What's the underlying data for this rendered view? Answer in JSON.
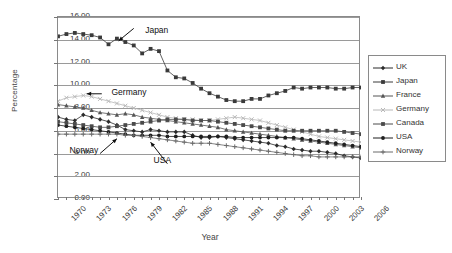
{
  "chart_data": {
    "type": "line",
    "title": "",
    "xlabel": "Year",
    "ylabel": "Percentage",
    "ylim": [
      0,
      16
    ],
    "ytick_labels": [
      "0.00",
      "2.00",
      "4.00",
      "6.00",
      "8.00",
      "10.00",
      "12.00",
      "14.00",
      "16.00"
    ],
    "ytick_values": [
      0,
      2,
      4,
      6,
      8,
      10,
      12,
      14,
      16
    ],
    "xlim": [
      1970,
      2006
    ],
    "xtick_labels": [
      "1970",
      "1973",
      "1976",
      "1979",
      "1982",
      "1985",
      "1988",
      "1991",
      "1994",
      "1997",
      "2000",
      "2003",
      "2006"
    ],
    "xtick_values": [
      1970,
      1973,
      1976,
      1979,
      1982,
      1985,
      1988,
      1991,
      1994,
      1997,
      2000,
      2003,
      2006
    ],
    "grid": "horizontal",
    "legend_position": "right",
    "x": [
      1970,
      1971,
      1972,
      1973,
      1974,
      1975,
      1976,
      1977,
      1978,
      1979,
      1980,
      1981,
      1982,
      1983,
      1984,
      1985,
      1986,
      1987,
      1988,
      1989,
      1990,
      1991,
      1992,
      1993,
      1994,
      1995,
      1996,
      1997,
      1998,
      1999,
      2000,
      2001,
      2002,
      2003,
      2004,
      2005,
      2006
    ],
    "series": [
      {
        "name": "UK",
        "marker": "diamond",
        "color": "#2b2b2b",
        "values": [
          7.2,
          7.0,
          6.9,
          7.4,
          7.2,
          7.0,
          6.8,
          6.5,
          6.1,
          6.0,
          5.9,
          6.1,
          6.0,
          5.9,
          5.9,
          5.9,
          5.6,
          5.4,
          5.4,
          5.5,
          5.4,
          5.3,
          5.2,
          5.1,
          5.0,
          4.9,
          4.7,
          4.6,
          4.4,
          4.3,
          4.2,
          4.2,
          4.1,
          4.0,
          3.8,
          3.7,
          3.6
        ]
      },
      {
        "name": "Japan",
        "marker": "square",
        "color": "#3a3a3a",
        "values": [
          14.3,
          14.5,
          14.6,
          14.5,
          14.4,
          14.2,
          13.6,
          14.1,
          13.8,
          13.5,
          12.8,
          13.2,
          13.0,
          11.3,
          10.7,
          10.6,
          10.2,
          9.7,
          9.3,
          9.0,
          8.7,
          8.6,
          8.6,
          8.8,
          8.8,
          9.1,
          9.3,
          9.5,
          9.8,
          9.7,
          9.8,
          9.8,
          9.8,
          9.7,
          9.7,
          9.8,
          9.8
        ]
      },
      {
        "name": "France",
        "marker": "triangle",
        "color": "#555555",
        "values": [
          8.3,
          8.2,
          8.1,
          8.0,
          7.8,
          7.6,
          7.5,
          7.4,
          7.5,
          7.4,
          7.2,
          7.1,
          7.0,
          6.9,
          6.8,
          6.7,
          6.6,
          6.5,
          6.4,
          6.3,
          6.1,
          6.0,
          5.9,
          5.8,
          5.7,
          5.6,
          5.5,
          5.4,
          5.3,
          5.2,
          5.1,
          5.0,
          4.9,
          4.8,
          4.7,
          4.6,
          4.5
        ]
      },
      {
        "name": "Germany",
        "marker": "x",
        "color": "#b8b8b8",
        "values": [
          8.6,
          8.9,
          9.0,
          9.1,
          9.0,
          8.8,
          8.6,
          8.4,
          8.2,
          8.0,
          7.8,
          7.6,
          7.4,
          7.2,
          7.1,
          7.0,
          7.0,
          6.9,
          6.9,
          7.0,
          7.1,
          7.2,
          7.1,
          7.0,
          6.9,
          6.7,
          6.5,
          6.3,
          6.1,
          5.9,
          5.7,
          5.5,
          5.4,
          5.3,
          5.2,
          5.1,
          5.0
        ]
      },
      {
        "name": "Canada",
        "marker": "square",
        "color": "#4a4a4a",
        "values": [
          6.8,
          6.7,
          6.6,
          6.5,
          6.4,
          6.3,
          6.3,
          6.4,
          6.5,
          6.6,
          6.7,
          6.8,
          6.9,
          7.0,
          7.0,
          7.0,
          6.9,
          6.9,
          6.9,
          6.8,
          6.7,
          6.6,
          6.5,
          6.4,
          6.3,
          6.2,
          6.1,
          6.0,
          6.0,
          6.0,
          6.0,
          6.0,
          6.0,
          6.0,
          5.9,
          5.8,
          5.7
        ]
      },
      {
        "name": "USA",
        "marker": "circle",
        "color": "#1f1f1f",
        "values": [
          6.5,
          6.4,
          6.3,
          6.2,
          6.1,
          6.0,
          5.9,
          5.8,
          5.7,
          5.6,
          5.6,
          5.6,
          5.6,
          5.5,
          5.5,
          5.5,
          5.5,
          5.5,
          5.5,
          5.5,
          5.5,
          5.4,
          5.4,
          5.4,
          5.4,
          5.4,
          5.4,
          5.4,
          5.4,
          5.3,
          5.2,
          5.1,
          5.0,
          4.9,
          4.8,
          4.7,
          4.6
        ]
      },
      {
        "name": "Norway",
        "marker": "plus",
        "color": "#6a6a6a",
        "values": [
          5.7,
          5.7,
          5.7,
          5.7,
          5.7,
          5.7,
          5.7,
          5.7,
          5.6,
          5.6,
          5.5,
          5.4,
          5.3,
          5.2,
          5.1,
          5.0,
          4.9,
          4.9,
          4.9,
          4.8,
          4.7,
          4.6,
          4.5,
          4.4,
          4.3,
          4.2,
          4.1,
          4.0,
          3.9,
          3.8,
          3.8,
          3.7,
          3.7,
          3.7,
          3.7,
          3.7,
          3.7
        ]
      }
    ],
    "annotations": [
      {
        "text": "Japan",
        "x": 1980,
        "y": 14.8
      },
      {
        "text": "Germany",
        "x": 1976,
        "y": 9.3
      },
      {
        "text": "Norway",
        "x": 1971,
        "y": 4.2
      },
      {
        "text": "USA",
        "x": 1981,
        "y": 3.3
      }
    ]
  },
  "legend": {
    "items": [
      {
        "label": "UK"
      },
      {
        "label": "Japan"
      },
      {
        "label": "France"
      },
      {
        "label": "Germany"
      },
      {
        "label": "Canada"
      },
      {
        "label": "USA"
      },
      {
        "label": "Norway"
      }
    ]
  }
}
